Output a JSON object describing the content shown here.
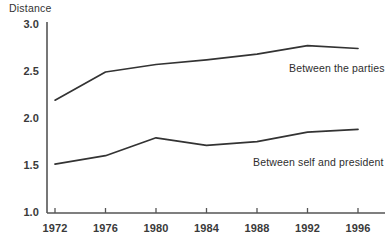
{
  "figure": {
    "axis_title": "Distance",
    "line_color": "#333333",
    "axis_color": "#555555",
    "background": "#ffffff"
  },
  "chart_data": {
    "type": "line",
    "title": "",
    "xlabel": "",
    "ylabel": "Distance",
    "categories": [
      "1972",
      "1976",
      "1980",
      "1984",
      "1988",
      "1992",
      "1996"
    ],
    "x": [
      1972,
      1976,
      1980,
      1984,
      1988,
      1992,
      1996
    ],
    "xlim": [
      1970,
      1998
    ],
    "ylim": [
      1.0,
      3.0
    ],
    "ytick_labels": [
      "1.0",
      "1.5",
      "2.0",
      "2.5",
      "3.0"
    ],
    "yticks": [
      1.0,
      1.5,
      2.0,
      2.5,
      3.0
    ],
    "grid": false,
    "legend_position": "inline-annotations",
    "series": [
      {
        "name": "Between the parties",
        "values": [
          2.2,
          2.5,
          2.58,
          2.63,
          2.69,
          2.78,
          2.75
        ]
      },
      {
        "name": "Between self and president",
        "values": [
          1.52,
          1.61,
          1.8,
          1.72,
          1.76,
          1.86,
          1.89
        ]
      }
    ],
    "annotations": [
      {
        "text": "Between the parties",
        "series": "Between the parties"
      },
      {
        "text": "Between self and president",
        "series": "Between self and president"
      }
    ]
  }
}
